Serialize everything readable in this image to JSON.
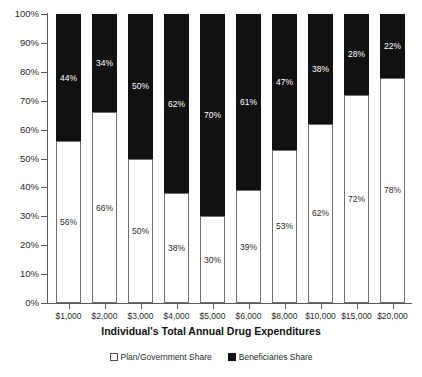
{
  "chart_data": {
    "type": "bar",
    "subtype": "stacked-100-percent",
    "title": "",
    "xlabel": "Individual's Total Annual Drug Expenditures",
    "ylabel": "",
    "ylim": [
      0,
      100
    ],
    "yticks": [
      0,
      10,
      20,
      30,
      40,
      50,
      60,
      70,
      80,
      90,
      100
    ],
    "ytick_labels": [
      "0%",
      "10%",
      "20%",
      "30%",
      "40%",
      "50%",
      "60%",
      "70%",
      "80%",
      "90%",
      "100%"
    ],
    "grid": false,
    "legend_position": "bottom",
    "categories": [
      "$1,000",
      "$2,000",
      "$3,000",
      "$4,000",
      "$5,000",
      "$6,000",
      "$8,000",
      "$10,000",
      "$15,000",
      "$20,000"
    ],
    "series": [
      {
        "name": "Plan/Government Share",
        "color": "#ffffff",
        "values": [
          56,
          66,
          50,
          38,
          30,
          39,
          53,
          62,
          72,
          78
        ],
        "labels": [
          "56%",
          "66%",
          "50%",
          "38%",
          "30%",
          "39%",
          "53%",
          "62%",
          "72%",
          "78%"
        ]
      },
      {
        "name": "Beneficiaries Share",
        "color": "#111111",
        "values": [
          44,
          34,
          50,
          62,
          70,
          61,
          47,
          38,
          28,
          22
        ],
        "labels": [
          "44%",
          "34%",
          "50%",
          "62%",
          "70%",
          "61%",
          "47%",
          "38%",
          "28%",
          "22%"
        ]
      }
    ]
  },
  "legend": {
    "items": [
      {
        "label": "Plan/Government Share",
        "swatch": "white-square-icon"
      },
      {
        "label": "Beneficiaries Share",
        "swatch": "black-square-icon"
      }
    ]
  }
}
